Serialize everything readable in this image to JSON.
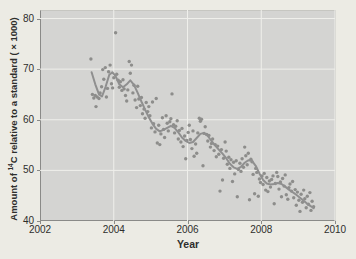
{
  "figure": {
    "background_color": "#ecebe4",
    "panel_background_color": "#d4d4d2",
    "grid_color": "#efefeb",
    "point_color": "#8d8d8b",
    "trend_line_color": "#8f8f8f",
    "text_color": "#2e2e2c",
    "ylabel_prefix": "Amount of ",
    "ylabel_superscript": "14",
    "ylabel_suffix": "C relative to a standard ( × 1000)",
    "xlabel": "Year"
  },
  "chart_data": {
    "type": "scatter",
    "title": "",
    "xlabel": "Year",
    "ylabel": "Amount of 14C relative to a standard (×1000)",
    "xlim": [
      2002,
      2010
    ],
    "ylim": [
      40,
      80
    ],
    "xticks": [
      2002,
      2004,
      2006,
      2008,
      2010
    ],
    "yticks": [
      40,
      50,
      60,
      70,
      80
    ],
    "grid": true,
    "legend_position": "none",
    "series": [
      {
        "name": "carbon-14 measurements",
        "type": "scatter",
        "points": [
          [
            2003.38,
            72.0
          ],
          [
            2003.42,
            65.0
          ],
          [
            2003.46,
            64.3
          ],
          [
            2003.5,
            64.8
          ],
          [
            2003.52,
            62.6
          ],
          [
            2003.55,
            64.5
          ],
          [
            2003.6,
            64.2
          ],
          [
            2003.63,
            65.3
          ],
          [
            2003.67,
            66.5
          ],
          [
            2003.7,
            69.9
          ],
          [
            2003.73,
            68.0
          ],
          [
            2003.77,
            70.3
          ],
          [
            2003.8,
            64.5
          ],
          [
            2003.83,
            66.2
          ],
          [
            2003.86,
            69.5
          ],
          [
            2003.9,
            70.8
          ],
          [
            2003.94,
            67.1
          ],
          [
            2003.97,
            66.3
          ],
          [
            2004.0,
            68.3
          ],
          [
            2004.05,
            77.2
          ],
          [
            2004.08,
            69.0
          ],
          [
            2004.12,
            67.8
          ],
          [
            2004.15,
            66.4
          ],
          [
            2004.18,
            67.5
          ],
          [
            2004.22,
            65.8
          ],
          [
            2004.25,
            67.9
          ],
          [
            2004.28,
            66.1
          ],
          [
            2004.32,
            64.8
          ],
          [
            2004.35,
            63.7
          ],
          [
            2004.38,
            65.9
          ],
          [
            2004.42,
            71.5
          ],
          [
            2004.45,
            69.2
          ],
          [
            2004.48,
            70.8
          ],
          [
            2004.52,
            65.3
          ],
          [
            2004.55,
            66.8
          ],
          [
            2004.58,
            63.9
          ],
          [
            2004.62,
            62.4
          ],
          [
            2004.65,
            66.6
          ],
          [
            2004.68,
            64.1
          ],
          [
            2004.72,
            62.8
          ],
          [
            2004.75,
            64.4
          ],
          [
            2004.78,
            61.2
          ],
          [
            2004.82,
            62.1
          ],
          [
            2004.85,
            60.3
          ],
          [
            2004.88,
            63.4
          ],
          [
            2004.92,
            61.6
          ],
          [
            2004.95,
            62.6
          ],
          [
            2004.98,
            60.8
          ],
          [
            2005.02,
            58.4
          ],
          [
            2005.05,
            63.5
          ],
          [
            2005.08,
            59.2
          ],
          [
            2005.12,
            57.6
          ],
          [
            2005.15,
            64.2
          ],
          [
            2005.18,
            55.4
          ],
          [
            2005.22,
            58.9
          ],
          [
            2005.25,
            55.1
          ],
          [
            2005.28,
            57.2
          ],
          [
            2005.32,
            60.4
          ],
          [
            2005.35,
            58.1
          ],
          [
            2005.38,
            56.5
          ],
          [
            2005.42,
            60.8
          ],
          [
            2005.45,
            59.3
          ],
          [
            2005.48,
            57.8
          ],
          [
            2005.52,
            59.6
          ],
          [
            2005.55,
            60.2
          ],
          [
            2005.58,
            65.1
          ],
          [
            2005.62,
            59.0
          ],
          [
            2005.65,
            57.4
          ],
          [
            2005.68,
            58.7
          ],
          [
            2005.72,
            59.8
          ],
          [
            2005.75,
            56.2
          ],
          [
            2005.78,
            57.9
          ],
          [
            2005.82,
            55.6
          ],
          [
            2005.85,
            58.3
          ],
          [
            2005.88,
            54.7
          ],
          [
            2005.92,
            56.8
          ],
          [
            2005.95,
            52.3
          ],
          [
            2005.98,
            55.9
          ],
          [
            2006.02,
            57.5
          ],
          [
            2006.05,
            58.9
          ],
          [
            2006.08,
            56.1
          ],
          [
            2006.12,
            54.3
          ],
          [
            2006.15,
            57.8
          ],
          [
            2006.18,
            52.8
          ],
          [
            2006.22,
            55.2
          ],
          [
            2006.25,
            53.4
          ],
          [
            2006.28,
            57.4
          ],
          [
            2006.32,
            60.3
          ],
          [
            2006.35,
            59.7
          ],
          [
            2006.38,
            60.1
          ],
          [
            2006.42,
            50.9
          ],
          [
            2006.45,
            57.3
          ],
          [
            2006.48,
            58.6
          ],
          [
            2006.52,
            57.1
          ],
          [
            2006.55,
            55.8
          ],
          [
            2006.58,
            56.9
          ],
          [
            2006.62,
            54.6
          ],
          [
            2006.65,
            55.3
          ],
          [
            2006.68,
            56.2
          ],
          [
            2006.72,
            53.9
          ],
          [
            2006.75,
            55.1
          ],
          [
            2006.78,
            52.7
          ],
          [
            2006.82,
            54.8
          ],
          [
            2006.85,
            53.2
          ],
          [
            2006.88,
            45.9
          ],
          [
            2006.92,
            54.1
          ],
          [
            2006.95,
            48.1
          ],
          [
            2006.98,
            52.4
          ],
          [
            2007.02,
            55.6
          ],
          [
            2007.05,
            53.8
          ],
          [
            2007.08,
            51.2
          ],
          [
            2007.12,
            52.6
          ],
          [
            2007.15,
            50.4
          ],
          [
            2007.18,
            52.1
          ],
          [
            2007.22,
            47.8
          ],
          [
            2007.25,
            51.6
          ],
          [
            2007.28,
            49.3
          ],
          [
            2007.32,
            51.9
          ],
          [
            2007.35,
            44.8
          ],
          [
            2007.38,
            50.2
          ],
          [
            2007.42,
            51.4
          ],
          [
            2007.45,
            49.8
          ],
          [
            2007.48,
            52.3
          ],
          [
            2007.52,
            50.6
          ],
          [
            2007.55,
            54.6
          ],
          [
            2007.58,
            52.9
          ],
          [
            2007.62,
            51.1
          ],
          [
            2007.65,
            53.4
          ],
          [
            2007.68,
            44.2
          ],
          [
            2007.72,
            52.2
          ],
          [
            2007.75,
            51.7
          ],
          [
            2007.78,
            49.2
          ],
          [
            2007.82,
            45.4
          ],
          [
            2007.85,
            50.4
          ],
          [
            2007.88,
            49.6
          ],
          [
            2007.92,
            44.9
          ],
          [
            2007.95,
            48.3
          ],
          [
            2007.98,
            47.6
          ],
          [
            2008.02,
            48.9
          ],
          [
            2008.05,
            47.2
          ],
          [
            2008.08,
            49.4
          ],
          [
            2008.12,
            46.1
          ],
          [
            2008.15,
            48.6
          ],
          [
            2008.18,
            45.8
          ],
          [
            2008.22,
            47.9
          ],
          [
            2008.25,
            46.7
          ],
          [
            2008.28,
            48.2
          ],
          [
            2008.32,
            48.9
          ],
          [
            2008.35,
            43.4
          ],
          [
            2008.38,
            47.4
          ],
          [
            2008.42,
            49.6
          ],
          [
            2008.45,
            48.8
          ],
          [
            2008.48,
            46.3
          ],
          [
            2008.52,
            47.7
          ],
          [
            2008.55,
            44.8
          ],
          [
            2008.58,
            48.4
          ],
          [
            2008.62,
            46.9
          ],
          [
            2008.65,
            49.1
          ],
          [
            2008.68,
            45.2
          ],
          [
            2008.72,
            44.3
          ],
          [
            2008.75,
            46.6
          ],
          [
            2008.78,
            47.3
          ],
          [
            2008.82,
            45.9
          ],
          [
            2008.85,
            47.8
          ],
          [
            2008.88,
            44.6
          ],
          [
            2008.92,
            46.2
          ],
          [
            2008.95,
            43.1
          ],
          [
            2008.98,
            45.7
          ],
          [
            2009.02,
            44.1
          ],
          [
            2009.05,
            41.9
          ],
          [
            2009.08,
            45.3
          ],
          [
            2009.12,
            43.7
          ],
          [
            2009.15,
            46.1
          ],
          [
            2009.18,
            44.4
          ],
          [
            2009.22,
            42.6
          ],
          [
            2009.25,
            44.9
          ],
          [
            2009.28,
            43.3
          ],
          [
            2009.32,
            45.6
          ],
          [
            2009.35,
            42.1
          ],
          [
            2009.38,
            43.9
          ],
          [
            2009.42,
            42.8
          ]
        ]
      },
      {
        "name": "smoothed trend",
        "type": "line",
        "points": [
          [
            2003.4,
            69.4
          ],
          [
            2003.5,
            67.0
          ],
          [
            2003.6,
            65.0
          ],
          [
            2003.68,
            64.6
          ],
          [
            2003.78,
            66.5
          ],
          [
            2003.88,
            68.9
          ],
          [
            2003.96,
            69.4
          ],
          [
            2004.05,
            68.6
          ],
          [
            2004.15,
            67.0
          ],
          [
            2004.25,
            66.4
          ],
          [
            2004.35,
            67.0
          ],
          [
            2004.45,
            67.8
          ],
          [
            2004.55,
            66.9
          ],
          [
            2004.65,
            65.3
          ],
          [
            2004.75,
            63.6
          ],
          [
            2004.85,
            62.0
          ],
          [
            2004.95,
            60.5
          ],
          [
            2005.05,
            59.2
          ],
          [
            2005.15,
            58.2
          ],
          [
            2005.25,
            57.7
          ],
          [
            2005.35,
            58.0
          ],
          [
            2005.45,
            58.4
          ],
          [
            2005.55,
            58.8
          ],
          [
            2005.65,
            58.4
          ],
          [
            2005.75,
            57.5
          ],
          [
            2005.85,
            56.5
          ],
          [
            2005.95,
            55.8
          ],
          [
            2006.05,
            55.4
          ],
          [
            2006.15,
            55.6
          ],
          [
            2006.25,
            56.4
          ],
          [
            2006.35,
            57.2
          ],
          [
            2006.45,
            57.4
          ],
          [
            2006.55,
            56.8
          ],
          [
            2006.65,
            55.8
          ],
          [
            2006.75,
            54.9
          ],
          [
            2006.85,
            54.1
          ],
          [
            2006.95,
            53.3
          ],
          [
            2007.05,
            52.4
          ],
          [
            2007.15,
            51.3
          ],
          [
            2007.25,
            50.6
          ],
          [
            2007.35,
            50.3
          ],
          [
            2007.45,
            50.7
          ],
          [
            2007.55,
            51.5
          ],
          [
            2007.65,
            52.0
          ],
          [
            2007.75,
            51.9
          ],
          [
            2007.85,
            50.9
          ],
          [
            2007.95,
            49.4
          ],
          [
            2008.05,
            48.1
          ],
          [
            2008.15,
            47.4
          ],
          [
            2008.25,
            47.2
          ],
          [
            2008.35,
            47.3
          ],
          [
            2008.45,
            47.5
          ],
          [
            2008.55,
            47.3
          ],
          [
            2008.65,
            46.8
          ],
          [
            2008.75,
            46.2
          ],
          [
            2008.85,
            45.7
          ],
          [
            2008.95,
            45.2
          ],
          [
            2009.05,
            44.6
          ],
          [
            2009.15,
            44.0
          ],
          [
            2009.25,
            43.4
          ],
          [
            2009.35,
            42.9
          ],
          [
            2009.42,
            42.5
          ]
        ]
      }
    ]
  }
}
